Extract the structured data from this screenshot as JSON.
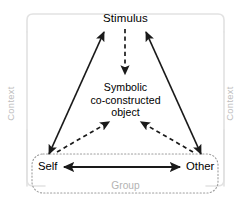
{
  "diagram": {
    "title_node": {
      "id": "stimulus",
      "label": "Stimulus"
    },
    "center_node": {
      "id": "symbolic-co-constructed-object",
      "line1": "Symbolic",
      "line2": "co-constructed",
      "line3": "object"
    },
    "group_box": {
      "id": "group",
      "label": "Group",
      "left_node": "Self",
      "right_node": "Other",
      "border_style": "dotted",
      "border_color": "#9e9e9e"
    },
    "context_frame": {
      "left_label": "Context",
      "right_label": "Context",
      "border_color": "#e0e0e0"
    },
    "colors": {
      "line": "#1a1a1a",
      "muted_text": "#b9b9b9",
      "group_border": "#9e9e9e",
      "frame_border": "#e2e2e2",
      "background": "#ffffff"
    },
    "edges": [
      {
        "id": "self-stimulus",
        "from": "Self",
        "to": "Stimulus",
        "style": "solid",
        "arrows": "both"
      },
      {
        "id": "other-stimulus",
        "from": "Other",
        "to": "Stimulus",
        "style": "solid",
        "arrows": "both"
      },
      {
        "id": "stimulus-object",
        "from": "Stimulus",
        "to": "Symbolic co-constructed object",
        "style": "dashed",
        "arrows": "to"
      },
      {
        "id": "self-object",
        "from": "Self",
        "to": "Symbolic co-constructed object",
        "style": "dashed",
        "arrows": "to"
      },
      {
        "id": "other-object",
        "from": "Other",
        "to": "Symbolic co-constructed object",
        "style": "dashed",
        "arrows": "to"
      },
      {
        "id": "self-other",
        "from": "Self",
        "to": "Other",
        "style": "solid",
        "arrows": "both"
      }
    ]
  }
}
